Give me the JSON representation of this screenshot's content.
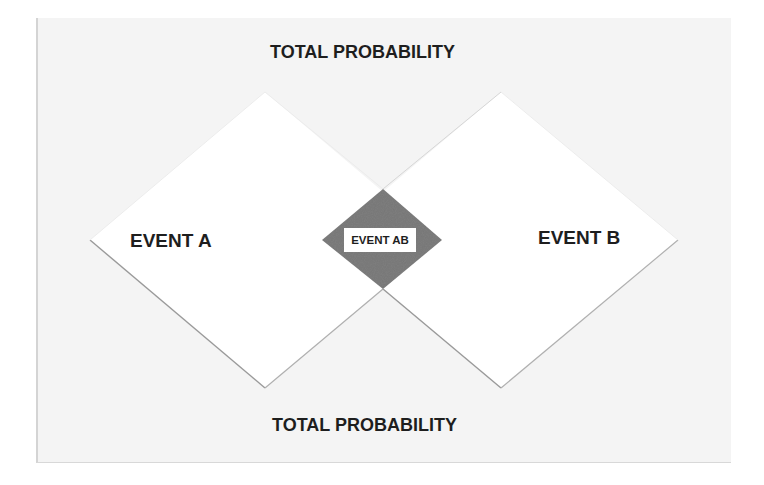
{
  "diagram": {
    "title_top": "TOTAL PROBABILITY",
    "title_bottom": "TOTAL PROBABILITY",
    "event_a": {
      "label": "EVENT A"
    },
    "event_b": {
      "label": "EVENT B"
    },
    "intersection": {
      "label": "EVENT AB"
    }
  },
  "colors": {
    "background_panel": "#f4f4f4",
    "event_fill": "#ffffff",
    "event_outline": "#a8a8a8",
    "intersection_fill": "#7e7e7e",
    "text": "#1e1e1e"
  }
}
